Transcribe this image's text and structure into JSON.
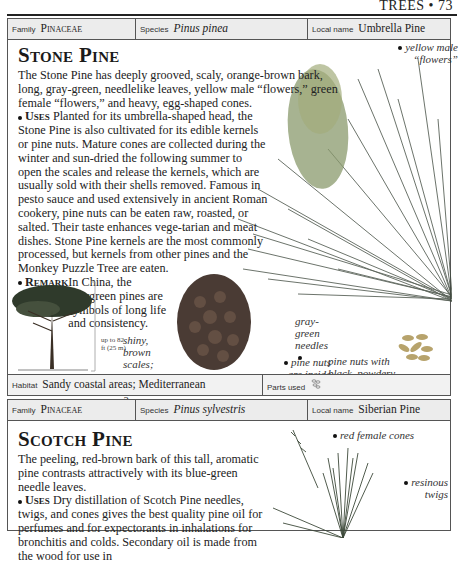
{
  "running_head": "TREES • 73",
  "entries": [
    {
      "meta": {
        "family_label": "Family",
        "family_value": "Pinaceae",
        "species_label": "Species",
        "species_value": "Pinus pinea",
        "local_label": "Local name",
        "local_value": "Umbrella Pine"
      },
      "title": "Stone Pine",
      "intro": "The Stone Pine has deeply grooved, scaly, orange-brown bark, long, gray-green, needlelike leaves, yellow male “flowers,” green female “flowers,” and heavy, egg-shaped cones.",
      "uses_label": "Uses",
      "uses_text": " Planted for its umbrella-shaped head, the Stone Pine is also cultivated for its edible kernels or pine nuts. Mature cones are collected during the winter and sun-dried the following summer to open the scales and release the kernels, which are usually sold with their shells removed. Famous in pesto sauce and used extensively in ancient Roman cookery, pine nuts can be eaten raw, roasted, or salted. Their taste enhances vege-tarian and meat dishes. Stone Pine kernels are the most commonly processed, but kernels from other pines and the Monkey Puzzle Tree are eaten.",
      "remark_label": "Remark",
      "remark_text": " In China, the evergreen pines are symbols of long life and consistency.",
      "height_note": "up to 82 ft (25 m)",
      "captions": {
        "male_flowers": "yellow male “flowers”",
        "needles": "gray-green needles",
        "cone_scales": "shiny, brown scales; cones mature over 3 years",
        "nuts_inside": "pine nuts are inside cone",
        "nuts_removed": "pine nuts with black, powdery casing removed"
      },
      "footer": {
        "habitat_label": "Habitat",
        "habitat_value": "Sandy coastal areas; Mediterranean",
        "parts_label": "Parts used",
        "parts_icon": "seeds-icon"
      }
    },
    {
      "meta": {
        "family_label": "Family",
        "family_value": "Pinaceae",
        "species_label": "Species",
        "species_value": "Pinus sylvestris",
        "local_label": "Local name",
        "local_value": "Siberian Pine"
      },
      "title": "Scotch Pine",
      "intro": "The peeling, red-brown bark of this tall, aromatic pine contrasts attractively with its blue-green needle leaves.",
      "uses_label": "Uses",
      "uses_text": " Dry distillation of Scotch Pine needles, twigs, and cones gives the best quality pine oil for perfumes and for expectorants in inhalations for bronchitis and colds. Secondary oil is made from the wood for use in",
      "captions": {
        "female_cones": "red female cones",
        "twigs": "resinous twigs"
      }
    }
  ]
}
